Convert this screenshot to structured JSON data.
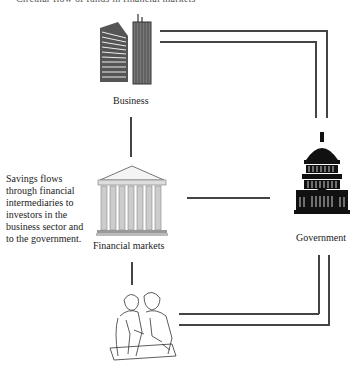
{
  "header": {
    "truncated_caption": "Circular flow of funds in financial markets"
  },
  "nodes": {
    "business": {
      "label": "Business",
      "icon": "office-buildings-icon"
    },
    "financial_markets": {
      "label": "Financial markets",
      "icon": "bank-columns-icon"
    },
    "government": {
      "label": "Government",
      "icon": "capitol-building-icon"
    },
    "households": {
      "label": "",
      "icon": "people-reviewing-plans-icon"
    }
  },
  "annotation": {
    "text": "Savings flows through financial intermediaries to investors in the business sector and to the government."
  },
  "colors": {
    "line": "#444444",
    "text": "#222222",
    "background": "#ffffff"
  }
}
